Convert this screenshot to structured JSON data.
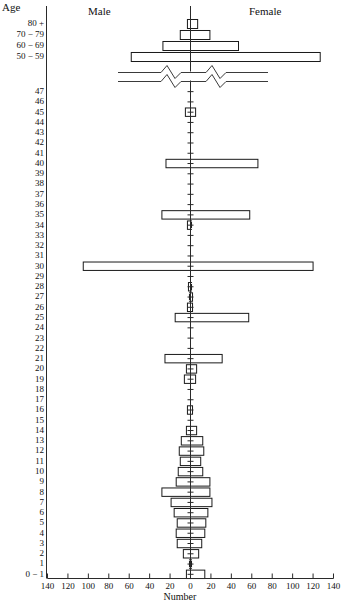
{
  "chart_data": {
    "type": "bar",
    "subtype": "population-pyramid",
    "title": "",
    "xlabel": "Number",
    "ylabel": "Age",
    "legend": [
      "Male",
      "Female"
    ],
    "legend_position": "top",
    "grid": false,
    "xlim": [
      -140,
      140
    ],
    "x_ticks": [
      140,
      120,
      100,
      80,
      60,
      40,
      20,
      0,
      20,
      40,
      60,
      80,
      100,
      120,
      140
    ],
    "x_tick_side_note": "mirrored axis: left side = Male, right side = Female",
    "axis_break_between": [
      "47",
      "50 − 59"
    ],
    "categories": [
      "80 +",
      "70 − 79",
      "60 − 69",
      "50 − 59",
      "47",
      "46",
      "45",
      "44",
      "43",
      "42",
      "41",
      "40",
      "39",
      "38",
      "37",
      "36",
      "35",
      "34",
      "33",
      "32",
      "31",
      "30",
      "29",
      "28",
      "27",
      "26",
      "25",
      "24",
      "23",
      "22",
      "21",
      "20",
      "19",
      "18",
      "17",
      "16",
      "15",
      "14",
      "13",
      "12",
      "11",
      "10",
      "9",
      "8",
      "7",
      "6",
      "5",
      "4",
      "3",
      "2",
      "1",
      "0 − 1"
    ],
    "series": [
      {
        "name": "Male",
        "values": [
          3,
          10,
          27,
          58,
          0,
          0,
          5,
          0,
          0,
          0,
          0,
          24,
          0,
          0,
          0,
          0,
          28,
          3,
          0,
          0,
          0,
          105,
          0,
          2,
          1,
          3,
          15,
          0,
          0,
          0,
          25,
          4,
          6,
          0,
          0,
          3,
          0,
          4,
          9,
          11,
          10,
          12,
          14,
          28,
          19,
          16,
          13,
          14,
          13,
          7,
          1,
          4
        ]
      },
      {
        "name": "Female",
        "values": [
          7,
          19,
          47,
          127,
          0,
          0,
          5,
          0,
          0,
          0,
          0,
          66,
          0,
          0,
          0,
          0,
          58,
          1,
          0,
          0,
          0,
          120,
          0,
          1,
          2,
          2,
          57,
          0,
          0,
          0,
          31,
          6,
          5,
          0,
          0,
          2,
          0,
          6,
          12,
          13,
          10,
          12,
          19,
          19,
          21,
          17,
          15,
          14,
          11,
          8,
          1,
          14
        ]
      }
    ]
  }
}
